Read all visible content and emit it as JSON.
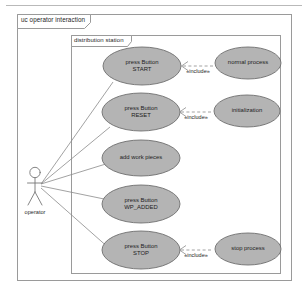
{
  "diagram": {
    "type": "uml-use-case-diagram",
    "outer_frame": {
      "label": "uc operator interaction"
    },
    "inner_frame": {
      "label": "distribution station"
    },
    "actor": {
      "name": "operator",
      "icon": "stick-figure-actor-icon"
    },
    "use_cases": [
      {
        "id": "press-start",
        "label_line1": "press Button",
        "label_line2": "START"
      },
      {
        "id": "normal-process",
        "label_line1": "normal process",
        "label_line2": ""
      },
      {
        "id": "press-reset",
        "label_line1": "press Button",
        "label_line2": "RESET"
      },
      {
        "id": "initialization",
        "label_line1": "initialization",
        "label_line2": ""
      },
      {
        "id": "add-work-pieces",
        "label_line1": "add work pieces",
        "label_line2": ""
      },
      {
        "id": "press-wp-added",
        "label_line1": "press Button",
        "label_line2": "WP_ADDED"
      },
      {
        "id": "press-stop",
        "label_line1": "press Button",
        "label_line2": "STOP"
      },
      {
        "id": "stop-process",
        "label_line1": "stop process",
        "label_line2": ""
      }
    ],
    "includes": [
      {
        "id": "include-normal-process",
        "label": "«include»"
      },
      {
        "id": "include-initialization",
        "label": "«include»"
      },
      {
        "id": "include-stop-process",
        "label": "«include»"
      }
    ],
    "colors": {
      "use_case_fill": "#b4b4b4",
      "use_case_stroke": "#6f6f6f",
      "frame_stroke": "#9a9a9a",
      "line": "#8a8a8a",
      "text": "#1d1d1d",
      "background": "#ffffff"
    }
  }
}
